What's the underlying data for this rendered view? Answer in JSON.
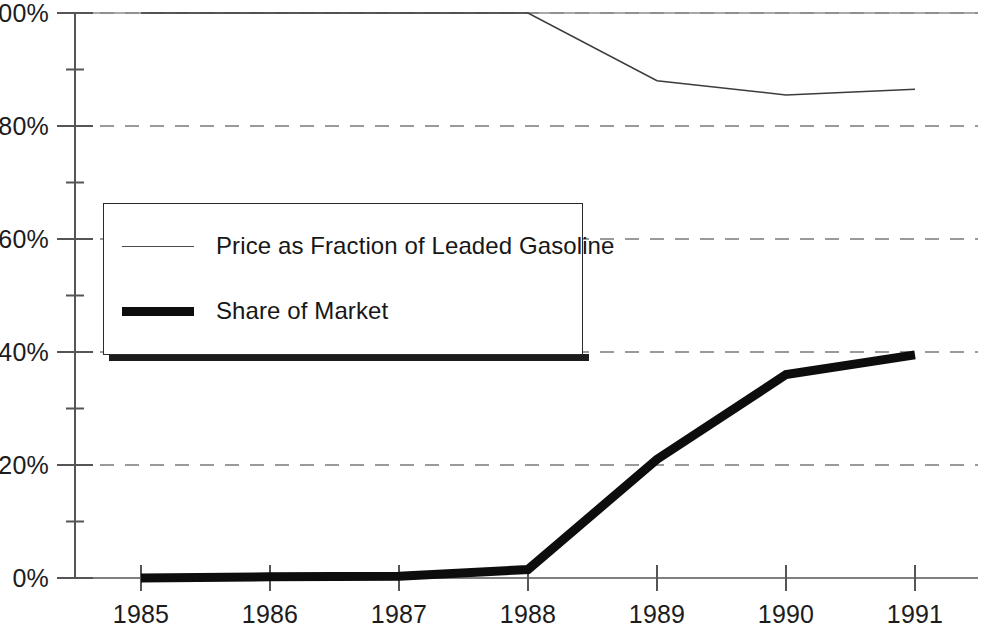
{
  "chart_data": {
    "type": "line",
    "title": "",
    "subtitle": "",
    "xlabel": "",
    "ylabel": "",
    "x": [
      1985,
      1986,
      1987,
      1988,
      1989,
      1990,
      1991
    ],
    "x_tick_labels": [
      "1985",
      "1986",
      "1987",
      "1988",
      "1989",
      "1990",
      "1991"
    ],
    "y_tick_labels": [
      "0%",
      "20%",
      "40%",
      "60%",
      "80%",
      "100%"
    ],
    "y_tick_values": [
      0,
      20,
      40,
      60,
      80,
      100
    ],
    "y_minor_tick_values": [
      10,
      30,
      50,
      70,
      90
    ],
    "ylim": [
      0,
      100
    ],
    "xlim": [
      1985,
      1991
    ],
    "grid": true,
    "grid_style": "dashed-horizontal",
    "grid_color": "#9a9a9a",
    "legend_position": "upper-left-inside",
    "series": [
      {
        "name": "Price as Fraction of Leaded Gasoline",
        "style": "thin",
        "color": "#3c3c3c",
        "width": 1.6,
        "values": [
          100,
          100,
          100,
          100,
          88,
          85.5,
          86.5
        ]
      },
      {
        "name": "Share of Market",
        "style": "thick",
        "color": "#0d0d0d",
        "width": 9,
        "values": [
          0,
          0.2,
          0.3,
          1.5,
          21,
          36,
          39.5
        ]
      }
    ]
  },
  "axes": {
    "y_labels": [
      {
        "text": "100%",
        "value": 100
      },
      {
        "text": "80%",
        "value": 80
      },
      {
        "text": "60%",
        "value": 60
      },
      {
        "text": "40%",
        "value": 40
      },
      {
        "text": "20%",
        "value": 20
      },
      {
        "text": "0%",
        "value": 0
      }
    ],
    "x_labels": [
      {
        "text": "1985",
        "value": 1985
      },
      {
        "text": "1986",
        "value": 1986
      },
      {
        "text": "1987",
        "value": 1987
      },
      {
        "text": "1988",
        "value": 1988
      },
      {
        "text": "1989",
        "value": 1989
      },
      {
        "text": "1990",
        "value": 1990
      },
      {
        "text": "1991",
        "value": 1991
      }
    ],
    "axis_color": "#555555"
  },
  "legend": {
    "entries": [
      {
        "label": "Price as Fraction of Leaded Gasoline",
        "swatch": "thin-line-swatch"
      },
      {
        "label": "Share of Market",
        "swatch": "thick-line-swatch"
      }
    ]
  }
}
